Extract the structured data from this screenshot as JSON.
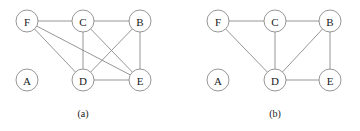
{
  "figure": {
    "width": 360,
    "height": 131,
    "background_color": "#ffffff",
    "node_fill_color": "#ffffff",
    "node_stroke_color": "#8a8a8a",
    "edge_color": "#8a8a8a",
    "label_color": "#1a1a1a",
    "node_radius": 11
  },
  "panels": [
    {
      "id": "panel-a",
      "caption": "(a)",
      "caption_x": 83,
      "caption_y": 117,
      "nodes": [
        {
          "id": "F",
          "label": "F",
          "cx": 27,
          "cy": 21
        },
        {
          "id": "C",
          "label": "C",
          "cx": 83,
          "cy": 21
        },
        {
          "id": "B",
          "label": "B",
          "cx": 140,
          "cy": 21
        },
        {
          "id": "A",
          "label": "A",
          "cx": 27,
          "cy": 80
        },
        {
          "id": "D",
          "label": "D",
          "cx": 83,
          "cy": 80
        },
        {
          "id": "E",
          "label": "E",
          "cx": 140,
          "cy": 80
        }
      ],
      "edges": [
        {
          "from": "F",
          "to": "C"
        },
        {
          "from": "C",
          "to": "B"
        },
        {
          "from": "F",
          "to": "D"
        },
        {
          "from": "F",
          "to": "E"
        },
        {
          "from": "C",
          "to": "D"
        },
        {
          "from": "C",
          "to": "E"
        },
        {
          "from": "B",
          "to": "D"
        },
        {
          "from": "B",
          "to": "E"
        },
        {
          "from": "D",
          "to": "E"
        }
      ],
      "isolated_nodes": [
        "A"
      ]
    },
    {
      "id": "panel-b",
      "caption": "(b)",
      "caption_x": 275,
      "caption_y": 117,
      "nodes": [
        {
          "id": "F",
          "label": "F",
          "cx": 218,
          "cy": 21
        },
        {
          "id": "C",
          "label": "C",
          "cx": 275,
          "cy": 21
        },
        {
          "id": "B",
          "label": "B",
          "cx": 330,
          "cy": 21
        },
        {
          "id": "A",
          "label": "A",
          "cx": 218,
          "cy": 80
        },
        {
          "id": "D",
          "label": "D",
          "cx": 275,
          "cy": 80
        },
        {
          "id": "E",
          "label": "E",
          "cx": 330,
          "cy": 80
        }
      ],
      "edges": [
        {
          "from": "F",
          "to": "C"
        },
        {
          "from": "C",
          "to": "B"
        },
        {
          "from": "F",
          "to": "D"
        },
        {
          "from": "C",
          "to": "D"
        },
        {
          "from": "B",
          "to": "D"
        },
        {
          "from": "B",
          "to": "E"
        },
        {
          "from": "D",
          "to": "E"
        }
      ],
      "isolated_nodes": [
        "A"
      ]
    }
  ]
}
